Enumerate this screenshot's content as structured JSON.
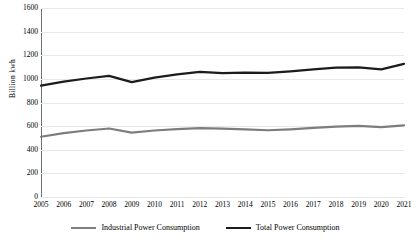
{
  "chart_data": {
    "type": "line",
    "title": "",
    "xlabel": "",
    "ylabel": "Billion  kwh",
    "ylim": [
      0,
      1600
    ],
    "ytick_step": 200,
    "grid": true,
    "legend_position": "bottom",
    "x": [
      2005,
      2006,
      2007,
      2008,
      2009,
      2010,
      2011,
      2012,
      2013,
      2014,
      2015,
      2016,
      2017,
      2018,
      2019,
      2020,
      2021
    ],
    "categories": [
      "2005",
      "2006",
      "2007",
      "2008",
      "2009",
      "2010",
      "2011",
      "2012",
      "2013",
      "2014",
      "2015",
      "2016",
      "2017",
      "2018",
      "2019",
      "2020",
      "2021"
    ],
    "ytick_labels": [
      "1600",
      "1400",
      "1200",
      "1000",
      "800",
      "600",
      "400",
      "200",
      "0"
    ],
    "ytick_values": [
      1600,
      1400,
      1200,
      1000,
      800,
      600,
      400,
      200,
      0
    ],
    "series": [
      {
        "name": "Industrial Power Consumption",
        "color": "#7d7d7d",
        "values": [
          510,
          540,
          563,
          580,
          545,
          563,
          575,
          583,
          578,
          573,
          565,
          573,
          585,
          595,
          602,
          592,
          607
        ]
      },
      {
        "name": "Total Power Consumption",
        "color": "#1c1c1c",
        "values": [
          943,
          977,
          1003,
          1025,
          972,
          1010,
          1038,
          1060,
          1048,
          1053,
          1050,
          1063,
          1080,
          1095,
          1098,
          1080,
          1127
        ]
      }
    ]
  },
  "legend": {
    "items": [
      {
        "label": "Industrial Power Consumption",
        "color": "#7d7d7d"
      },
      {
        "label": "Total Power Consumption",
        "color": "#1c1c1c"
      }
    ]
  },
  "colors": {
    "industrial": "#7d7d7d",
    "total": "#1c1c1c",
    "gridline": "#e8e8e8",
    "axis": "#6f6f6f",
    "background": "#ffffff"
  }
}
